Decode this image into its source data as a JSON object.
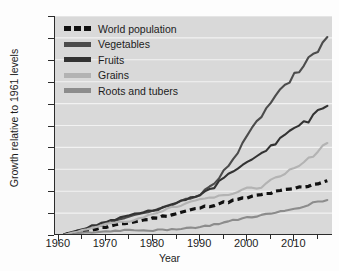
{
  "chart_data": {
    "type": "line",
    "title": "",
    "xlabel": "Year",
    "ylabel": "Growth relative to 1961 levels",
    "xlim": [
      1961,
      2017
    ],
    "ylim": [
      1.0,
      6.0
    ],
    "xticks": [
      1960,
      1970,
      1980,
      1990,
      2000,
      2010
    ],
    "yticks": [
      "6.0",
      "5.5",
      "4.5",
      "4.0",
      "3.5",
      "3.0",
      "2.5",
      "2.0",
      "1.5",
      "1.0"
    ],
    "ytick_values": [
      6.0,
      5.5,
      5.0,
      4.5,
      4.0,
      3.5,
      3.0,
      2.5,
      2.0,
      1.5,
      1.0
    ],
    "grid": "horizontal-white",
    "legend_position": "top-left",
    "plot_background": "#d9d9d9",
    "gridline_color": "#f2f2f2",
    "series": [
      {
        "name": "World population",
        "color": "#111111",
        "style": "dashed",
        "x": [
          1961,
          1965,
          1970,
          1975,
          1980,
          1985,
          1990,
          1995,
          2000,
          2005,
          2010,
          2013,
          2017
        ],
        "values": [
          1.0,
          1.08,
          1.18,
          1.28,
          1.38,
          1.49,
          1.62,
          1.74,
          1.85,
          1.96,
          2.06,
          2.13,
          2.24
        ]
      },
      {
        "name": "Vegetables",
        "color": "#4c4c4c",
        "style": "solid",
        "x": [
          1961,
          1965,
          1970,
          1975,
          1980,
          1985,
          1990,
          1993,
          1995,
          1998,
          2000,
          2003,
          2005,
          2008,
          2010,
          2013,
          2015,
          2017
        ],
        "values": [
          1.0,
          1.12,
          1.26,
          1.42,
          1.55,
          1.72,
          1.93,
          2.18,
          2.45,
          2.9,
          3.24,
          3.72,
          4.0,
          4.42,
          4.66,
          5.0,
          5.24,
          5.52
        ]
      },
      {
        "name": "Fruits",
        "color": "#333333",
        "style": "solid",
        "x": [
          1961,
          1965,
          1970,
          1975,
          1980,
          1985,
          1990,
          1993,
          1995,
          1998,
          2000,
          2003,
          2005,
          2008,
          2010,
          2013,
          2015,
          2017
        ],
        "values": [
          1.0,
          1.14,
          1.3,
          1.45,
          1.57,
          1.74,
          1.92,
          2.1,
          2.32,
          2.52,
          2.64,
          2.86,
          3.02,
          3.28,
          3.44,
          3.62,
          3.8,
          3.95
        ]
      },
      {
        "name": "Grains",
        "color": "#b3b3b3",
        "style": "solid",
        "x": [
          1961,
          1965,
          1970,
          1975,
          1980,
          1985,
          1990,
          1995,
          2000,
          2003,
          2005,
          2008,
          2010,
          2013,
          2015,
          2017
        ],
        "values": [
          1.0,
          1.1,
          1.24,
          1.32,
          1.48,
          1.66,
          1.82,
          1.9,
          2.06,
          2.08,
          2.28,
          2.42,
          2.52,
          2.74,
          2.9,
          3.1
        ]
      },
      {
        "name": "Roots and tubers",
        "color": "#8c8c8c",
        "style": "solid",
        "x": [
          1961,
          1965,
          1970,
          1975,
          1980,
          1985,
          1990,
          1995,
          2000,
          2005,
          2010,
          2013,
          2015,
          2017
        ],
        "values": [
          1.0,
          1.04,
          1.08,
          1.12,
          1.1,
          1.14,
          1.18,
          1.28,
          1.4,
          1.48,
          1.6,
          1.7,
          1.76,
          1.8
        ]
      }
    ]
  },
  "legend": {
    "entries": [
      {
        "label": "World population",
        "color": "#111111",
        "style": "dashed"
      },
      {
        "label": "Vegetables",
        "color": "#4c4c4c",
        "style": "solid"
      },
      {
        "label": "Fruits",
        "color": "#333333",
        "style": "solid"
      },
      {
        "label": "Grains",
        "color": "#b3b3b3",
        "style": "solid"
      },
      {
        "label": "Roots and tubers",
        "color": "#8c8c8c",
        "style": "solid"
      }
    ]
  }
}
